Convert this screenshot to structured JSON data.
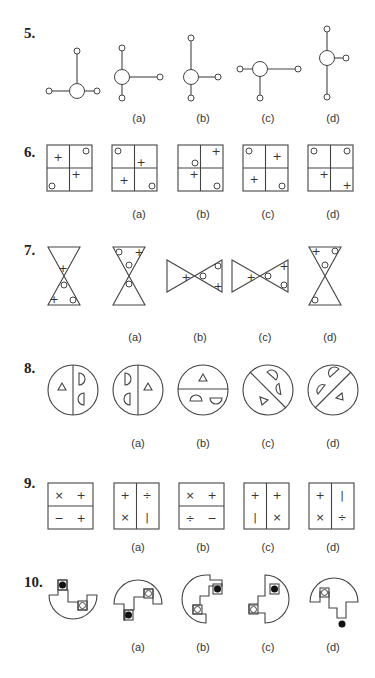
{
  "questions": [
    {
      "number": "5.",
      "options": [
        "(a)",
        "(b)",
        "(c)",
        "(d)"
      ],
      "figure_type": "ball-and-stick"
    },
    {
      "number": "6.",
      "options": [
        "(a)",
        "(b)",
        "(c)",
        "(d)"
      ],
      "figure_type": "2x2-grid-with-plus-and-circle"
    },
    {
      "number": "7.",
      "options": [
        "(a)",
        "(b)",
        "(c)",
        "(d)"
      ],
      "figure_type": "hourglass-triangles"
    },
    {
      "number": "8.",
      "options": [
        "(a)",
        "(b)",
        "(c)",
        "(d)"
      ],
      "figure_type": "divided-circle-with-shapes"
    },
    {
      "number": "9.",
      "options": [
        "(a)",
        "(b)",
        "(c)",
        "(d)"
      ],
      "figure_type": "divided-square-with-symbols"
    },
    {
      "number": "10.",
      "options": [
        "(a)",
        "(b)",
        "(c)",
        "(d)"
      ],
      "figure_type": "semicircle-with-steps-and-dots"
    }
  ],
  "symbols": {
    "plus": "+",
    "times": "×",
    "minus": "−",
    "divide": "÷",
    "bar": "|"
  },
  "row9": {
    "question": [
      [
        "×",
        "+"
      ],
      [
        "−",
        "+"
      ]
    ],
    "a": [
      [
        "+",
        "÷"
      ],
      [
        "×",
        "|"
      ]
    ],
    "b": [
      [
        "×",
        "+"
      ],
      [
        "÷",
        "−"
      ]
    ],
    "c": [
      [
        "+",
        "+"
      ],
      [
        "|",
        "×"
      ]
    ],
    "d": [
      [
        "+",
        "|"
      ],
      [
        "×",
        "÷"
      ]
    ]
  },
  "colors": {
    "line": "#444444",
    "text": "#222222",
    "background": "#ffffff"
  }
}
